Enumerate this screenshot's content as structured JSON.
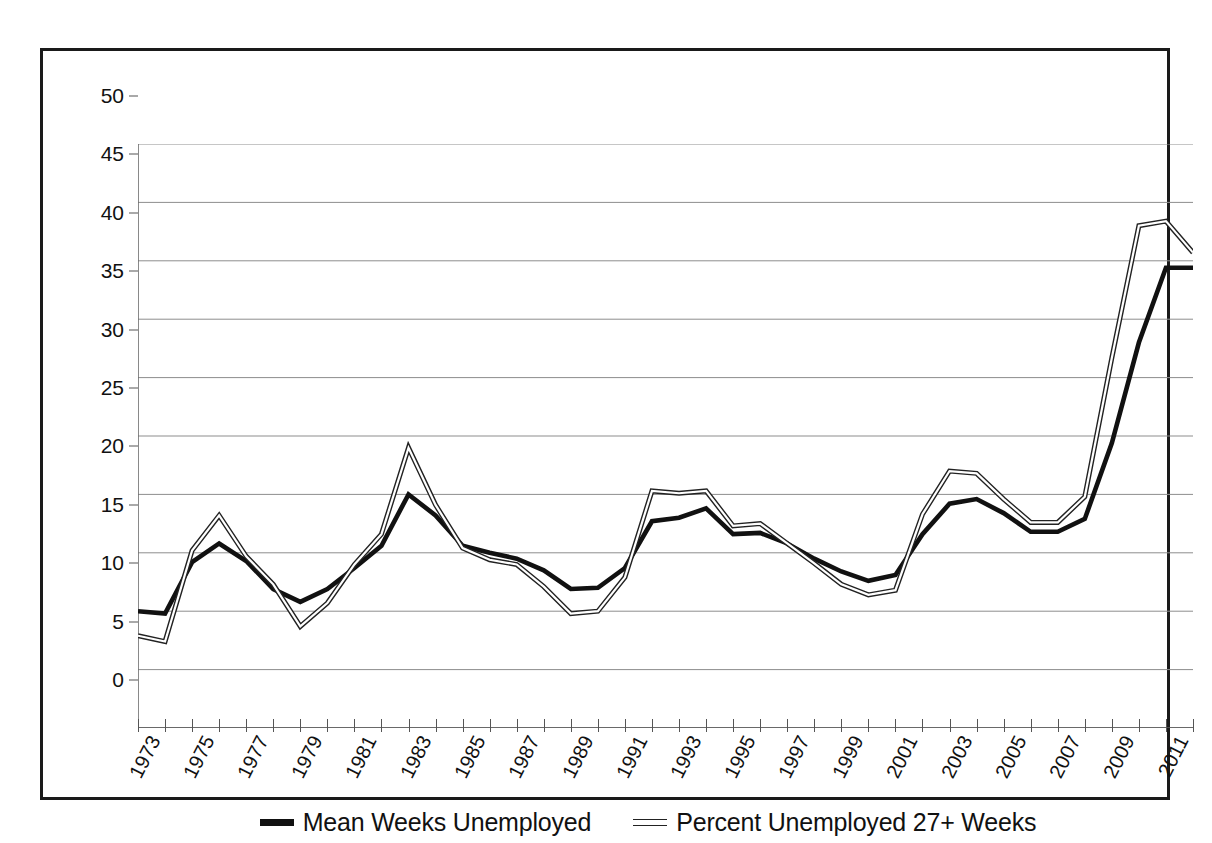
{
  "chart_data": {
    "type": "line",
    "title": "",
    "subtitle": "",
    "xlabel": "",
    "ylabel": "",
    "xlim": [
      1973,
      2012
    ],
    "ylim": [
      0,
      50
    ],
    "ytick_step": 5,
    "yticks": [
      0,
      5,
      10,
      15,
      20,
      25,
      30,
      35,
      40,
      45,
      50
    ],
    "grid": "horizontal",
    "legend_position": "bottom-center",
    "x": [
      1973,
      1974,
      1975,
      1976,
      1977,
      1978,
      1979,
      1980,
      1981,
      1982,
      1983,
      1984,
      1985,
      1986,
      1987,
      1988,
      1989,
      1990,
      1991,
      1992,
      1993,
      1994,
      1995,
      1996,
      1997,
      1998,
      1999,
      2000,
      2001,
      2002,
      2003,
      2004,
      2005,
      2006,
      2007,
      2008,
      2009,
      2010,
      2011,
      2012
    ],
    "xtick_labels": [
      "1973",
      "",
      "1975",
      "",
      "1977",
      "",
      "1979",
      "",
      "1981",
      "",
      "1983",
      "",
      "1985",
      "",
      "1987",
      "",
      "1989",
      "",
      "1991",
      "",
      "1993",
      "",
      "1995",
      "",
      "1997",
      "",
      "1999",
      "",
      "2001",
      "",
      "2003",
      "",
      "2005",
      "",
      "2007",
      "",
      "2009",
      "",
      "2011",
      ""
    ],
    "series": [
      {
        "name": "Mean Weeks Unemployed",
        "style": "thick-solid",
        "color": "#111111",
        "values": [
          10.0,
          9.8,
          14.2,
          15.8,
          14.3,
          11.9,
          10.8,
          11.9,
          13.7,
          15.6,
          20.0,
          18.2,
          15.6,
          15.0,
          14.5,
          13.5,
          11.9,
          12.0,
          13.7,
          17.7,
          18.0,
          18.8,
          16.6,
          16.7,
          15.8,
          14.5,
          13.4,
          12.6,
          13.1,
          16.6,
          19.2,
          19.6,
          18.4,
          16.8,
          16.8,
          17.9,
          24.4,
          33.0,
          39.4,
          39.4
        ]
      },
      {
        "name": "Percent Unemployed 27+ Weeks",
        "style": "thin-hollow",
        "color": "#222222",
        "values": [
          7.9,
          7.4,
          15.2,
          18.2,
          14.7,
          12.3,
          8.7,
          10.7,
          14.0,
          16.6,
          24.0,
          19.1,
          15.4,
          14.4,
          14.0,
          12.1,
          9.8,
          10.0,
          12.9,
          20.3,
          20.1,
          20.3,
          17.3,
          17.5,
          15.8,
          14.1,
          12.3,
          11.4,
          11.8,
          18.3,
          22.0,
          21.8,
          19.6,
          17.6,
          17.6,
          19.8,
          31.7,
          43.0,
          43.4,
          40.7
        ]
      }
    ]
  },
  "legend": {
    "items": [
      {
        "label": "Mean Weeks Unemployed",
        "swatch": "solid-line-swatch"
      },
      {
        "label": "Percent Unemployed 27+ Weeks",
        "swatch": "hollow-line-swatch"
      }
    ]
  }
}
